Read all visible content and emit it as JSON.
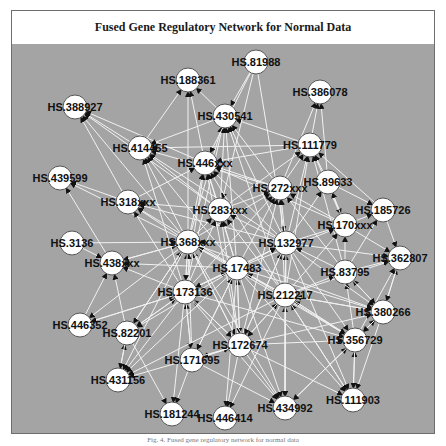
{
  "figure": {
    "title": "Fused Gene Regulatory Network for Normal Data",
    "caption": "Fig. 4. Fused gene regulatory network for normal data",
    "colors": {
      "background": "#a4a4a4",
      "edge": "#f2f2f2",
      "arrowhead": "#111111",
      "node_fill": "#ffffff",
      "node_stroke": "#555555",
      "frame": "#6e6e6e"
    }
  },
  "network": {
    "nodes": [
      {
        "id": "n1",
        "label": "HS.188361",
        "x": 188,
        "y": 80
      },
      {
        "id": "n2",
        "label": "HS.81988",
        "x": 256,
        "y": 62
      },
      {
        "id": "n3",
        "label": "HS.386078",
        "x": 320,
        "y": 92
      },
      {
        "id": "n4",
        "label": "HS.388927",
        "x": 75,
        "y": 107
      },
      {
        "id": "n5",
        "label": "HS.430541",
        "x": 225,
        "y": 116
      },
      {
        "id": "n6",
        "label": "HS.414455",
        "x": 140,
        "y": 148
      },
      {
        "id": "n7",
        "label": "HS.111779",
        "x": 310,
        "y": 145
      },
      {
        "id": "n8",
        "label": "HS.446xxx",
        "x": 205,
        "y": 163
      },
      {
        "id": "n9",
        "label": "HS.439599",
        "x": 60,
        "y": 178
      },
      {
        "id": "n10",
        "label": "HS.318xxx",
        "x": 128,
        "y": 202
      },
      {
        "id": "n11",
        "label": "HS.272xxx",
        "x": 280,
        "y": 188
      },
      {
        "id": "n12",
        "label": "HS.89633",
        "x": 328,
        "y": 182
      },
      {
        "id": "n13",
        "label": "HS.283xxx",
        "x": 220,
        "y": 210
      },
      {
        "id": "n14",
        "label": "HS.185726",
        "x": 383,
        "y": 210
      },
      {
        "id": "n15",
        "label": "HS.170xxx",
        "x": 345,
        "y": 225
      },
      {
        "id": "n16",
        "label": "HS.368xxx",
        "x": 188,
        "y": 242
      },
      {
        "id": "n17",
        "label": "HS.3136",
        "x": 72,
        "y": 243
      },
      {
        "id": "n18",
        "label": "HS.438xxx",
        "x": 112,
        "y": 263
      },
      {
        "id": "n19",
        "label": "HS.132977",
        "x": 286,
        "y": 243
      },
      {
        "id": "n20",
        "label": "HS.362807",
        "x": 400,
        "y": 258
      },
      {
        "id": "n21",
        "label": "HS.17483",
        "x": 237,
        "y": 268
      },
      {
        "id": "n22",
        "label": "HS.83795",
        "x": 345,
        "y": 272
      },
      {
        "id": "n23",
        "label": "HS.173136",
        "x": 185,
        "y": 292
      },
      {
        "id": "n24",
        "label": "HS.212217",
        "x": 285,
        "y": 295
      },
      {
        "id": "n25",
        "label": "HS.446352",
        "x": 80,
        "y": 325
      },
      {
        "id": "n26",
        "label": "HS.82201",
        "x": 127,
        "y": 333
      },
      {
        "id": "n27",
        "label": "HS.380266",
        "x": 383,
        "y": 312
      },
      {
        "id": "n28",
        "label": "HS.172674",
        "x": 240,
        "y": 345
      },
      {
        "id": "n29",
        "label": "HS.356729",
        "x": 355,
        "y": 340
      },
      {
        "id": "n30",
        "label": "HS.171695",
        "x": 192,
        "y": 360
      },
      {
        "id": "n31",
        "label": "HS.431156",
        "x": 118,
        "y": 380
      },
      {
        "id": "n32",
        "label": "HS.111903",
        "x": 353,
        "y": 400
      },
      {
        "id": "n33",
        "label": "HS.181244",
        "x": 172,
        "y": 414
      },
      {
        "id": "n34",
        "label": "HS.446414",
        "x": 225,
        "y": 418
      },
      {
        "id": "n35",
        "label": "HS.434992",
        "x": 285,
        "y": 408
      }
    ],
    "edges": [
      [
        "n6",
        "n4"
      ],
      [
        "n8",
        "n4"
      ],
      [
        "n10",
        "n4"
      ],
      [
        "n16",
        "n4"
      ],
      [
        "n13",
        "n4"
      ],
      [
        "n5",
        "n1"
      ],
      [
        "n8",
        "n1"
      ],
      [
        "n16",
        "n1"
      ],
      [
        "n6",
        "n1"
      ],
      [
        "n13",
        "n5"
      ],
      [
        "n16",
        "n5"
      ],
      [
        "n11",
        "n5"
      ],
      [
        "n19",
        "n5"
      ],
      [
        "n21",
        "n5"
      ],
      [
        "n23",
        "n5"
      ],
      [
        "n2",
        "n5"
      ],
      [
        "n7",
        "n5"
      ],
      [
        "n24",
        "n5"
      ],
      [
        "n2",
        "n8"
      ],
      [
        "n2",
        "n13"
      ],
      [
        "n2",
        "n19"
      ],
      [
        "n7",
        "n3"
      ],
      [
        "n12",
        "n3"
      ],
      [
        "n11",
        "n3"
      ],
      [
        "n16",
        "n6"
      ],
      [
        "n13",
        "n6"
      ],
      [
        "n21",
        "n6"
      ],
      [
        "n23",
        "n6"
      ],
      [
        "n11",
        "n6"
      ],
      [
        "n19",
        "n6"
      ],
      [
        "n7",
        "n6"
      ],
      [
        "n5",
        "n6"
      ],
      [
        "n11",
        "n7"
      ],
      [
        "n19",
        "n7"
      ],
      [
        "n24",
        "n7"
      ],
      [
        "n15",
        "n7"
      ],
      [
        "n22",
        "n7"
      ],
      [
        "n14",
        "n7"
      ],
      [
        "n12",
        "n7"
      ],
      [
        "n13",
        "n7"
      ],
      [
        "n16",
        "n8"
      ],
      [
        "n13",
        "n8"
      ],
      [
        "n21",
        "n8"
      ],
      [
        "n23",
        "n8"
      ],
      [
        "n19",
        "n8"
      ],
      [
        "n24",
        "n8"
      ],
      [
        "n11",
        "n8"
      ],
      [
        "n10",
        "n8"
      ],
      [
        "n15",
        "n8"
      ],
      [
        "n28",
        "n8"
      ],
      [
        "n7",
        "n8"
      ],
      [
        "n10",
        "n9"
      ],
      [
        "n18",
        "n9"
      ],
      [
        "n16",
        "n9"
      ],
      [
        "n16",
        "n10"
      ],
      [
        "n13",
        "n10"
      ],
      [
        "n21",
        "n10"
      ],
      [
        "n23",
        "n10"
      ],
      [
        "n19",
        "n10"
      ],
      [
        "n13",
        "n11"
      ],
      [
        "n19",
        "n11"
      ],
      [
        "n21",
        "n11"
      ],
      [
        "n24",
        "n11"
      ],
      [
        "n16",
        "n11"
      ],
      [
        "n15",
        "n11"
      ],
      [
        "n22",
        "n11"
      ],
      [
        "n28",
        "n11"
      ],
      [
        "n23",
        "n11"
      ],
      [
        "n12",
        "n15"
      ],
      [
        "n15",
        "n12"
      ],
      [
        "n19",
        "n12"
      ],
      [
        "n16",
        "n13"
      ],
      [
        "n21",
        "n13"
      ],
      [
        "n23",
        "n13"
      ],
      [
        "n19",
        "n13"
      ],
      [
        "n24",
        "n13"
      ],
      [
        "n28",
        "n13"
      ],
      [
        "n15",
        "n14"
      ],
      [
        "n22",
        "n14"
      ],
      [
        "n12",
        "n14"
      ],
      [
        "n19",
        "n15"
      ],
      [
        "n24",
        "n15"
      ],
      [
        "n22",
        "n15"
      ],
      [
        "n21",
        "n15"
      ],
      [
        "n21",
        "n16"
      ],
      [
        "n23",
        "n16"
      ],
      [
        "n19",
        "n16"
      ],
      [
        "n24",
        "n16"
      ],
      [
        "n28",
        "n16"
      ],
      [
        "n18",
        "n16"
      ],
      [
        "n26",
        "n16"
      ],
      [
        "n30",
        "n16"
      ],
      [
        "n17",
        "n16"
      ],
      [
        "n16",
        "n18"
      ],
      [
        "n23",
        "n18"
      ],
      [
        "n21",
        "n18"
      ],
      [
        "n26",
        "n18"
      ],
      [
        "n25",
        "n18"
      ],
      [
        "n17",
        "n18"
      ],
      [
        "n21",
        "n19"
      ],
      [
        "n24",
        "n19"
      ],
      [
        "n22",
        "n19"
      ],
      [
        "n23",
        "n19"
      ],
      [
        "n28",
        "n19"
      ],
      [
        "n27",
        "n20"
      ],
      [
        "n29",
        "n20"
      ],
      [
        "n22",
        "n20"
      ],
      [
        "n24",
        "n20"
      ],
      [
        "n15",
        "n20"
      ],
      [
        "n14",
        "n20"
      ],
      [
        "n19",
        "n20"
      ],
      [
        "n23",
        "n21"
      ],
      [
        "n24",
        "n21"
      ],
      [
        "n28",
        "n21"
      ],
      [
        "n30",
        "n21"
      ],
      [
        "n24",
        "n22"
      ],
      [
        "n27",
        "n22"
      ],
      [
        "n29",
        "n22"
      ],
      [
        "n26",
        "n23"
      ],
      [
        "n28",
        "n23"
      ],
      [
        "n30",
        "n23"
      ],
      [
        "n25",
        "n23"
      ],
      [
        "n21",
        "n23"
      ],
      [
        "n16",
        "n23"
      ],
      [
        "n28",
        "n24"
      ],
      [
        "n29",
        "n24"
      ],
      [
        "n27",
        "n24"
      ],
      [
        "n35",
        "n24"
      ],
      [
        "n32",
        "n24"
      ],
      [
        "n23",
        "n25"
      ],
      [
        "n16",
        "n25"
      ],
      [
        "n23",
        "n26"
      ],
      [
        "n21",
        "n26"
      ],
      [
        "n16",
        "n26"
      ],
      [
        "n31",
        "n26"
      ],
      [
        "n24",
        "n27"
      ],
      [
        "n21",
        "n27"
      ],
      [
        "n19",
        "n27"
      ],
      [
        "n22",
        "n27"
      ],
      [
        "n28",
        "n27"
      ],
      [
        "n16",
        "n27"
      ],
      [
        "n29",
        "n27"
      ],
      [
        "n20",
        "n27"
      ],
      [
        "n23",
        "n28"
      ],
      [
        "n24",
        "n28"
      ],
      [
        "n21",
        "n28"
      ],
      [
        "n19",
        "n28"
      ],
      [
        "n16",
        "n28"
      ],
      [
        "n30",
        "n28"
      ],
      [
        "n24",
        "n29"
      ],
      [
        "n21",
        "n29"
      ],
      [
        "n19",
        "n29"
      ],
      [
        "n28",
        "n29"
      ],
      [
        "n23",
        "n29"
      ],
      [
        "n27",
        "n29"
      ],
      [
        "n32",
        "n29"
      ],
      [
        "n35",
        "n29"
      ],
      [
        "n16",
        "n29"
      ],
      [
        "n23",
        "n30"
      ],
      [
        "n28",
        "n30"
      ],
      [
        "n21",
        "n30"
      ],
      [
        "n23",
        "n31"
      ],
      [
        "n21",
        "n31"
      ],
      [
        "n16",
        "n31"
      ],
      [
        "n24",
        "n31"
      ],
      [
        "n26",
        "n31"
      ],
      [
        "n28",
        "n31"
      ],
      [
        "n29",
        "n32"
      ],
      [
        "n24",
        "n32"
      ],
      [
        "n28",
        "n32"
      ],
      [
        "n19",
        "n32"
      ],
      [
        "n21",
        "n32"
      ],
      [
        "n27",
        "n32"
      ],
      [
        "n30",
        "n33"
      ],
      [
        "n26",
        "n33"
      ],
      [
        "n23",
        "n33"
      ],
      [
        "n28",
        "n34"
      ],
      [
        "n24",
        "n34"
      ],
      [
        "n21",
        "n34"
      ],
      [
        "n28",
        "n35"
      ],
      [
        "n24",
        "n35"
      ],
      [
        "n21",
        "n35"
      ],
      [
        "n23",
        "n35"
      ],
      [
        "n19",
        "n35"
      ],
      [
        "n16",
        "n35"
      ],
      [
        "n29",
        "n35"
      ],
      [
        "n30",
        "n35"
      ]
    ]
  }
}
